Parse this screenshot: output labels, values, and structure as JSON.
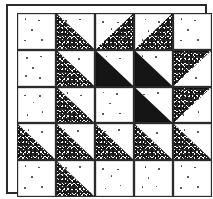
{
  "figure": {
    "rows": 5,
    "columns": 5,
    "frame_color": "#2b2b2b",
    "background_color": "#ffffff",
    "stipple_color": "#1e1e1e",
    "solid_color": "#151515"
  },
  "legend": {
    "plain": "plain",
    "stipple": "stipple",
    "solid": "solid"
  },
  "grid": {
    "cells": [
      [
        {
          "fill": "plain",
          "orientation": "none",
          "label": "R1C1"
        },
        {
          "fill": "stipple",
          "orientation": "bottom-left",
          "label": "R1C2"
        },
        {
          "fill": "stipple",
          "orientation": "bottom-right",
          "label": "R1C3"
        },
        {
          "fill": "stipple",
          "orientation": "bottom-right",
          "label": "R1C4"
        },
        {
          "fill": "plain",
          "orientation": "none",
          "label": "R1C5"
        }
      ],
      [
        {
          "fill": "plain",
          "orientation": "none",
          "label": "R2C1"
        },
        {
          "fill": "stipple",
          "orientation": "bottom-left",
          "label": "R2C2"
        },
        {
          "fill": "solid",
          "orientation": "bottom-left",
          "label": "R2C3"
        },
        {
          "fill": "solid",
          "orientation": "bottom-left",
          "label": "R2C4"
        },
        {
          "fill": "stipple",
          "orientation": "top-left",
          "label": "R2C5"
        }
      ],
      [
        {
          "fill": "plain",
          "orientation": "none",
          "label": "R3C1"
        },
        {
          "fill": "stipple",
          "orientation": "bottom-left",
          "label": "R3C2"
        },
        {
          "fill": "plain",
          "orientation": "none",
          "label": "R3C3"
        },
        {
          "fill": "solid",
          "orientation": "bottom-left",
          "label": "R3C4"
        },
        {
          "fill": "stipple",
          "orientation": "top-left",
          "label": "R3C5"
        }
      ],
      [
        {
          "fill": "stipple",
          "orientation": "bottom-left",
          "label": "R4C1"
        },
        {
          "fill": "stipple",
          "orientation": "bottom-left",
          "label": "R4C2"
        },
        {
          "fill": "stipple",
          "orientation": "bottom-left",
          "label": "R4C3"
        },
        {
          "fill": "stipple",
          "orientation": "bottom-left",
          "label": "R4C4"
        },
        {
          "fill": "stipple",
          "orientation": "bottom-left",
          "label": "R4C5"
        }
      ],
      [
        {
          "fill": "plain",
          "orientation": "none",
          "label": "R5C1"
        },
        {
          "fill": "stipple",
          "orientation": "bottom-left",
          "label": "R5C2"
        },
        {
          "fill": "plain",
          "orientation": "none",
          "label": "R5C3"
        },
        {
          "fill": "plain",
          "orientation": "none",
          "label": "R5C4"
        },
        {
          "fill": "plain",
          "orientation": "none",
          "label": "R5C5"
        }
      ]
    ]
  },
  "dot_layouts": [
    [
      [
        18,
        12
      ],
      [
        54,
        16
      ],
      [
        36,
        44
      ],
      [
        16,
        74
      ],
      [
        62,
        72
      ]
    ],
    [
      [
        22,
        18
      ],
      [
        60,
        14
      ],
      [
        38,
        48
      ],
      [
        20,
        70
      ],
      [
        58,
        76
      ]
    ],
    [
      [
        16,
        20
      ],
      [
        58,
        22
      ],
      [
        40,
        40
      ],
      [
        24,
        76
      ],
      [
        64,
        68
      ]
    ],
    [
      [
        26,
        14
      ],
      [
        62,
        20
      ],
      [
        34,
        46
      ],
      [
        18,
        72
      ],
      [
        56,
        70
      ]
    ]
  ]
}
